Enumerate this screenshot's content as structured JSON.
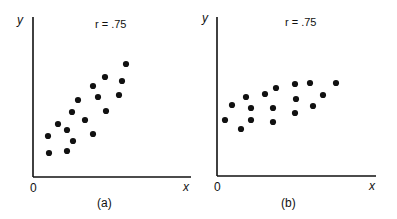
{
  "chart_data": [
    {
      "type": "scatter",
      "panel_label": "(a)",
      "annotation": "r = .75",
      "xlabel": "x",
      "ylabel": "y",
      "origin_label": "0",
      "grid": false,
      "xlim": [
        0,
        158
      ],
      "ylim": [
        0,
        160
      ],
      "points": [
        [
          93,
          113
        ],
        [
          72,
          100
        ],
        [
          89,
          96
        ],
        [
          60,
          91
        ],
        [
          65,
          80
        ],
        [
          86,
          82
        ],
        [
          45,
          77
        ],
        [
          73,
          66
        ],
        [
          39,
          65
        ],
        [
          52,
          57
        ],
        [
          25,
          53
        ],
        [
          34,
          47
        ],
        [
          15,
          41
        ],
        [
          60,
          43
        ],
        [
          40,
          36
        ],
        [
          16,
          24
        ],
        [
          34,
          26
        ]
      ]
    },
    {
      "type": "scatter",
      "panel_label": "(b)",
      "annotation": "r = .75",
      "xlabel": "x",
      "ylabel": "y",
      "origin_label": "0",
      "grid": false,
      "xlim": [
        0,
        158
      ],
      "ylim": [
        0,
        159
      ],
      "points": [
        [
          8,
          56
        ],
        [
          15,
          71
        ],
        [
          24,
          47
        ],
        [
          29,
          79
        ],
        [
          34,
          68
        ],
        [
          34,
          56
        ],
        [
          48,
          82
        ],
        [
          56,
          68
        ],
        [
          56,
          54
        ],
        [
          59,
          88
        ],
        [
          78,
          92
        ],
        [
          79,
          77
        ],
        [
          78,
          63
        ],
        [
          93,
          93
        ],
        [
          96,
          70
        ],
        [
          106,
          81
        ],
        [
          119,
          93
        ]
      ]
    }
  ],
  "panels": [
    {
      "label": "(a)",
      "annotation": "r = .75",
      "x_axis": "x",
      "y_axis": "y",
      "origin": "0"
    },
    {
      "label": "(b)",
      "annotation": "r = .75",
      "x_axis": "x",
      "y_axis": "y",
      "origin": "0"
    }
  ],
  "colors": {
    "ink": "#111111",
    "background": "#ffffff"
  }
}
